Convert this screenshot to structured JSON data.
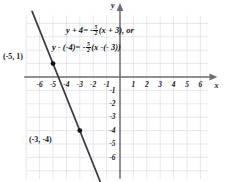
{
  "chart_data": {
    "type": "line",
    "title": "",
    "xlabel": "x",
    "ylabel": "y",
    "xlim": [
      -7.4,
      6.6
    ],
    "ylim": [
      -7.7,
      4.7
    ],
    "grid": true,
    "x_ticks": [
      -6,
      -5,
      -4,
      -3,
      -2,
      -1,
      1,
      2,
      3,
      4,
      5,
      6
    ],
    "y_ticks": [
      -1,
      -2,
      -3,
      -4,
      -5,
      -6
    ],
    "x_tick_labels": [
      "-6",
      "-5",
      "-4",
      "-3",
      "-2",
      "-1",
      "1",
      "2",
      "3",
      "4",
      "5",
      "6"
    ],
    "y_tick_labels": [
      "-1",
      "-2",
      "-3",
      "-4",
      "-5",
      "-6"
    ],
    "series": [
      {
        "name": "line",
        "slope": -2.5,
        "intercept": -11.5,
        "points": [
          {
            "x": -5,
            "y": 1,
            "label": "(-5, 1)",
            "marked": true
          },
          {
            "x": -3,
            "y": -4,
            "label": "(-3, -4)",
            "marked": true
          }
        ]
      }
    ],
    "annotations": {
      "equation_line1": {
        "lhs": "y + 4",
        "eq": "= -",
        "frac_num": "5",
        "frac_den": "2",
        "rhs": "(x + 3), or"
      },
      "equation_line2": {
        "lhs": "y - (-4)",
        "eq": "= -",
        "frac_num": "5",
        "frac_den": "2",
        "rhs": "(x -(- 3))"
      }
    },
    "colors": {
      "grid": "#d8dce6",
      "axis": "#6e6e78",
      "line": "#3a3a42",
      "point": "#111118",
      "text": "#1a1a1a"
    }
  }
}
